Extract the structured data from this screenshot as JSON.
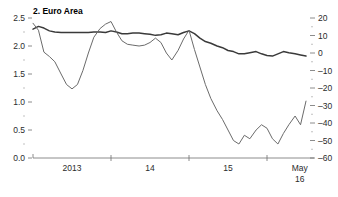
{
  "chart_data": {
    "type": "line",
    "title": "2. Euro Area",
    "xlabel": "",
    "ylabel": "",
    "grid": false,
    "legend": "none",
    "x_ticks": [
      {
        "label": "2013",
        "pos": 0.5
      },
      {
        "label": "14",
        "pos": 1.5
      },
      {
        "label": "15",
        "pos": 2.5
      },
      {
        "label": "May",
        "pos": 3.42
      },
      {
        "label": "16",
        "pos": 3.42
      }
    ],
    "x_tick_marks": [
      0.0,
      1.0,
      2.0,
      3.0
    ],
    "xlim": [
      0,
      3.5
    ],
    "left_axis": {
      "ylim": [
        0.0,
        2.5
      ],
      "major_ticks": [
        0.0,
        0.5,
        1.0,
        1.5,
        2.0,
        2.5
      ],
      "major_tick_labels": [
        "0.0",
        "0.5",
        "1.0",
        "1.5",
        "2.0",
        "2.5"
      ],
      "minor_ticks": [
        0.25,
        0.75,
        1.25,
        1.75,
        2.25
      ]
    },
    "right_axis": {
      "ylim": [
        -60,
        20
      ],
      "major_ticks": [
        20,
        10,
        0,
        -10,
        -20,
        -30,
        -40,
        -50,
        -60
      ],
      "major_tick_labels": [
        "20",
        "10",
        "0",
        "–10",
        "–20",
        "–30",
        "–40",
        "–50",
        "–60"
      ],
      "minor_ticks": [
        15,
        5,
        -5,
        -15,
        -25,
        -35,
        -45,
        -55
      ]
    },
    "series": [
      {
        "name": "left-axis-series",
        "axis": "left",
        "color": "#3a3a3a",
        "width": 1.5,
        "x": [
          0.0,
          0.07,
          0.14,
          0.21,
          0.28,
          0.36,
          0.43,
          0.5,
          0.57,
          0.64,
          0.71,
          0.78,
          0.86,
          0.93,
          1.0,
          1.07,
          1.14,
          1.21,
          1.28,
          1.36,
          1.43,
          1.5,
          1.57,
          1.64,
          1.71,
          1.78,
          1.86,
          1.93,
          2.0,
          2.07,
          2.14,
          2.21,
          2.28,
          2.36,
          2.43,
          2.5,
          2.57,
          2.64,
          2.71,
          2.78,
          2.86,
          2.93,
          3.0,
          3.07,
          3.14,
          3.21,
          3.28,
          3.36,
          3.43,
          3.5
        ],
        "values": [
          2.3,
          2.35,
          2.32,
          2.27,
          2.25,
          2.24,
          2.24,
          2.24,
          2.24,
          2.24,
          2.24,
          2.25,
          2.25,
          2.24,
          2.27,
          2.25,
          2.22,
          2.22,
          2.23,
          2.23,
          2.22,
          2.21,
          2.19,
          2.2,
          2.23,
          2.22,
          2.2,
          2.24,
          2.27,
          2.22,
          2.14,
          2.08,
          2.05,
          2.0,
          1.97,
          1.92,
          1.9,
          1.86,
          1.86,
          1.88,
          1.9,
          1.86,
          1.83,
          1.82,
          1.86,
          1.9,
          1.88,
          1.86,
          1.84,
          1.82
        ]
      },
      {
        "name": "right-axis-series",
        "axis": "right",
        "color": "#6b6b6b",
        "width": 1.0,
        "x": [
          0.0,
          0.07,
          0.14,
          0.21,
          0.28,
          0.36,
          0.43,
          0.5,
          0.57,
          0.64,
          0.71,
          0.78,
          0.86,
          0.93,
          1.0,
          1.07,
          1.14,
          1.21,
          1.28,
          1.36,
          1.43,
          1.5,
          1.57,
          1.64,
          1.71,
          1.78,
          1.86,
          1.93,
          2.0,
          2.07,
          2.14,
          2.21,
          2.28,
          2.36,
          2.43,
          2.5,
          2.57,
          2.64,
          2.71,
          2.78,
          2.86,
          2.93,
          3.0,
          3.07,
          3.14,
          3.21,
          3.28,
          3.36,
          3.43,
          3.5
        ],
        "values": [
          17.0,
          13.0,
          0.5,
          -2.0,
          -5.0,
          -12.0,
          -18.0,
          -20.5,
          -18.0,
          -10.0,
          0.0,
          9.0,
          14.0,
          16.5,
          18.0,
          12.0,
          7.0,
          5.0,
          4.5,
          4.0,
          4.5,
          6.0,
          8.5,
          6.0,
          0.0,
          -4.0,
          1.5,
          8.0,
          13.0,
          2.0,
          -8.0,
          -18.0,
          -26.0,
          -33.0,
          -38.0,
          -44.0,
          -50.0,
          -52.0,
          -47.0,
          -49.0,
          -44.0,
          -41.0,
          -43.0,
          -49.0,
          -52.0,
          -46.0,
          -41.0,
          -36.0,
          -41.0,
          -27.5
        ]
      }
    ]
  }
}
